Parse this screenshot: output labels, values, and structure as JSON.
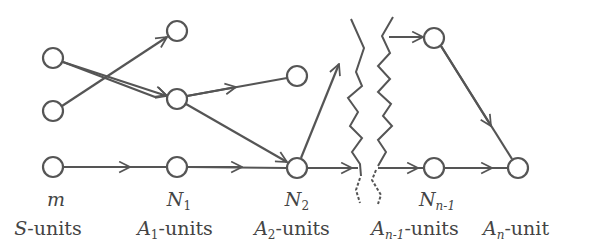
{
  "diagram": {
    "type": "layered-network",
    "stroke_color": "#555555",
    "node_radius": 10,
    "layers": [
      {
        "id": "S",
        "count_label": "m",
        "unit_label_main": "S",
        "unit_label_sub": "",
        "unit_label_suffix": "-units",
        "x": 53,
        "nodes": [
          {
            "id": "s1",
            "y": 58
          },
          {
            "id": "s2",
            "y": 111
          },
          {
            "id": "s3",
            "y": 167
          }
        ]
      },
      {
        "id": "A1",
        "count_label_main": "N",
        "count_label_sub": "1",
        "unit_label_main": "A",
        "unit_label_sub": "1",
        "unit_label_suffix": "-units",
        "x": 177,
        "nodes": [
          {
            "id": "a1_1",
            "y": 31
          },
          {
            "id": "a1_2",
            "y": 99
          },
          {
            "id": "a1_3",
            "y": 167
          }
        ]
      },
      {
        "id": "A2",
        "count_label_main": "N",
        "count_label_sub": "2",
        "unit_label_main": "A",
        "unit_label_sub": "2",
        "unit_label_suffix": "-units",
        "x": 297,
        "nodes": [
          {
            "id": "a2_1",
            "y": 76
          },
          {
            "id": "a2_2",
            "y": 168
          }
        ]
      },
      {
        "id": "An-1",
        "count_label_main": "N",
        "count_label_sub": "n-1",
        "unit_label_main": "A",
        "unit_label_sub": "n-1",
        "unit_label_suffix": "-units",
        "x": 434,
        "nodes": [
          {
            "id": "an1_1",
            "y": 38
          },
          {
            "id": "an1_2",
            "y": 168
          }
        ]
      },
      {
        "id": "An",
        "count_label": "",
        "unit_label_main": "A",
        "unit_label_sub": "n",
        "unit_label_suffix": "-unit",
        "x": 518,
        "nodes": [
          {
            "id": "an",
            "y": 168
          }
        ]
      }
    ],
    "edges": [
      {
        "from": "s1",
        "to": "a1_2"
      },
      {
        "from": "s2",
        "to": "a1_1"
      },
      {
        "from": "s3",
        "to": "a1_3"
      },
      {
        "from": "a1_2",
        "to": "a2_1"
      },
      {
        "from": "a1_2",
        "to": "a2_2"
      },
      {
        "from": "a1_3",
        "to": "a2_2"
      },
      {
        "from": "a2_2",
        "to": "break_up"
      },
      {
        "from": "a2_2",
        "to": "break_right"
      },
      {
        "from": "break_top",
        "to": "an1_1"
      },
      {
        "from": "break_bottom",
        "to": "an1_2"
      },
      {
        "from": "an1_1",
        "to": "an"
      },
      {
        "from": "an1_2",
        "to": "an"
      }
    ],
    "break_marker": "double zigzag line indicating omitted intermediate layers"
  },
  "labels": {
    "m": "m",
    "s_units": "S",
    "units": "-units",
    "unit": "-unit",
    "N": "N",
    "A": "A",
    "sub_1": "1",
    "sub_2": "2",
    "sub_n1": "n-1",
    "sub_n": "n"
  }
}
